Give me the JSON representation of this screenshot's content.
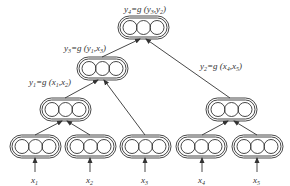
{
  "diagram": {
    "type": "recursive-neural-network-tree",
    "nodes": [
      {
        "id": "x1",
        "label": "x",
        "sub": "1",
        "level": 0
      },
      {
        "id": "x2",
        "label": "x",
        "sub": "2",
        "level": 0
      },
      {
        "id": "x3",
        "label": "x",
        "sub": "3",
        "level": 0
      },
      {
        "id": "x4",
        "label": "x",
        "sub": "4",
        "level": 0
      },
      {
        "id": "x5",
        "label": "x",
        "sub": "5",
        "level": 0
      },
      {
        "id": "y1",
        "equation": "y1=g(x1,x2)",
        "level": 1
      },
      {
        "id": "y2",
        "equation": "y2=g(x4,x5)",
        "level": 1
      },
      {
        "id": "y3",
        "equation": "y3=g(y1,x3)",
        "level": 2
      },
      {
        "id": "y4",
        "equation": "y4=g(y3,y2)",
        "level": 3
      }
    ],
    "edges": [
      [
        "x1",
        "y1"
      ],
      [
        "x2",
        "y1"
      ],
      [
        "y1",
        "y3"
      ],
      [
        "x3",
        "y3"
      ],
      [
        "x4",
        "y2"
      ],
      [
        "x5",
        "y2"
      ],
      [
        "y3",
        "y4"
      ],
      [
        "y2",
        "y4"
      ]
    ],
    "units_per_node": 3
  },
  "labels": {
    "y4": {
      "lhs": "y",
      "lhs_sub": "4",
      "eq": "=g (",
      "a": "y",
      "a_sub": "3",
      "sep": ",",
      "b": "y",
      "b_sub": "2",
      "close": ")"
    },
    "y3": {
      "lhs": "y",
      "lhs_sub": "3",
      "eq": "=g (",
      "a": "y",
      "a_sub": "1",
      "sep": ",",
      "b": "x",
      "b_sub": "3",
      "close": ")"
    },
    "y1": {
      "lhs": "y",
      "lhs_sub": "1",
      "eq": "=g (",
      "a": "x",
      "a_sub": "1",
      "sep": ",",
      "b": "x",
      "b_sub": "2",
      "close": ")"
    },
    "y2": {
      "lhs": "y",
      "lhs_sub": "2",
      "eq": "=g (",
      "a": "x",
      "a_sub": "4",
      "sep": ",",
      "b": "x",
      "b_sub": "5",
      "close": ")"
    },
    "x1": {
      "v": "x",
      "sub": "1"
    },
    "x2": {
      "v": "x",
      "sub": "2"
    },
    "x3": {
      "v": "x",
      "sub": "3"
    },
    "x4": {
      "v": "x",
      "sub": "4"
    },
    "x5": {
      "v": "x",
      "sub": "5"
    }
  },
  "colors": {
    "stroke": "#333333",
    "background": "#ffffff"
  }
}
